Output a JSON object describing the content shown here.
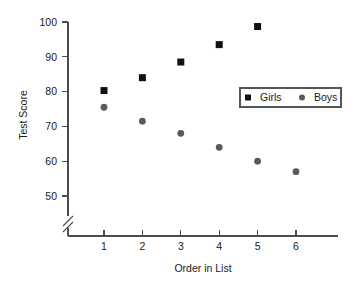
{
  "chart_data": {
    "type": "scatter",
    "title": "",
    "xlabel": "Order in List",
    "ylabel": "Test Score",
    "categories": [
      1,
      2,
      3,
      4,
      5,
      6
    ],
    "x": [
      1,
      2,
      3,
      4,
      5,
      6
    ],
    "xlim": [
      0.45,
      6.55
    ],
    "ylim": [
      45,
      101
    ],
    "y_axis_break": true,
    "y_axis_break_below": 50,
    "grid": false,
    "legend_position": "inside-right",
    "y_ticks": [
      50,
      60,
      70,
      80,
      90,
      100
    ],
    "x_ticks": [
      1,
      2,
      3,
      4,
      5,
      6
    ],
    "series": [
      {
        "name": "Girls",
        "marker": "square",
        "color": "#111111",
        "x": [
          1,
          2,
          3,
          4,
          5
        ],
        "values": [
          80.3,
          84.0,
          88.5,
          93.5,
          98.7
        ]
      },
      {
        "name": "Boys",
        "marker": "circle",
        "color": "#5a5a5a",
        "x": [
          1,
          2,
          3,
          4,
          5,
          6
        ],
        "values": [
          75.5,
          71.5,
          68.0,
          64.0,
          60.0,
          57.0
        ]
      }
    ]
  },
  "axes": {
    "y_title": "Test Score",
    "x_title": "Order in List",
    "y_tick_labels": [
      "50",
      "60",
      "70",
      "80",
      "90",
      "100"
    ],
    "x_tick_labels": [
      "1",
      "2",
      "3",
      "4",
      "5",
      "6"
    ]
  },
  "legend": {
    "entries": [
      {
        "label": "Girls",
        "marker": "square",
        "color": "#111111"
      },
      {
        "label": "Boys",
        "marker": "circle",
        "color": "#5a5a5a"
      }
    ]
  }
}
